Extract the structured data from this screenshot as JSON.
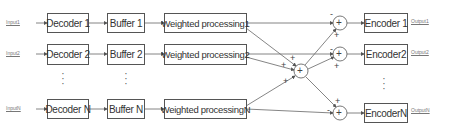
{
  "diagram": {
    "inputs": [
      "Input1",
      "Input2",
      "InputN"
    ],
    "decoders": [
      "Decoder 1",
      "Decoder 2",
      "Decoder N"
    ],
    "buffers": [
      "Buffer 1",
      "Buffer 2",
      "Buffer N"
    ],
    "weighted": [
      "Weighted processing1",
      "Weighted processing2",
      "Weighted processingN"
    ],
    "encoders": [
      "Encoder 1",
      "Encoder2",
      "EncoderN"
    ],
    "outputs": [
      "Output1",
      "Output2",
      "OutputN"
    ],
    "sum_symbol": "+",
    "signs": {
      "plus": "+",
      "minus": "-"
    },
    "ellipsis": "⋮",
    "colors": {
      "line": "#555555",
      "box_border": "#555555",
      "text": "#333333"
    }
  }
}
